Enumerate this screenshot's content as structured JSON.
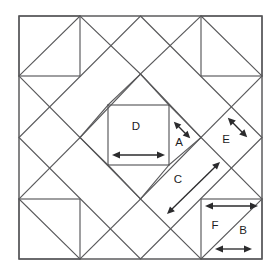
{
  "figure": {
    "type": "geometric-quilt-block-diagram",
    "background_color": "#ffffff",
    "line_color": "#58585a",
    "arrow_color": "#2b2b2d",
    "label_color": "#1c1c1e"
  },
  "frame": {
    "name": "outer-square",
    "left": 19,
    "top": 16,
    "right": 262,
    "bottom": 259,
    "width": 243,
    "height": 243
  },
  "corner_squares": [
    {
      "name": "top-left-corner-square",
      "left": 19,
      "top": 16,
      "right": 80,
      "bottom": 76,
      "diagonal": "top-right-to-bottom-left"
    },
    {
      "name": "top-right-corner-square",
      "left": 201,
      "top": 16,
      "right": 262,
      "bottom": 76,
      "diagonal": "top-left-to-bottom-right"
    },
    {
      "name": "bottom-left-corner-square",
      "left": 19,
      "top": 199,
      "right": 80,
      "bottom": 259,
      "diagonal": "top-left-to-bottom-right"
    },
    {
      "name": "bottom-right-corner-square",
      "left": 201,
      "top": 199,
      "right": 262,
      "bottom": 259,
      "diagonal": "bottom-left-to-top-right"
    }
  ],
  "center_square": {
    "name": "center-square-D",
    "left": 108,
    "top": 105,
    "right": 169,
    "bottom": 165
  },
  "outer_diamond": {
    "name": "outer-diamond",
    "vertices": [
      [
        140.5,
        16
      ],
      [
        262,
        137.5
      ],
      [
        140.5,
        259
      ],
      [
        19,
        137.5
      ]
    ]
  },
  "inner_diamond": {
    "name": "inner-diamond",
    "vertices": [
      [
        140.5,
        74
      ],
      [
        201,
        137.5
      ],
      [
        140.5,
        199
      ],
      [
        80,
        137.5
      ]
    ]
  },
  "labels": [
    {
      "id": "A",
      "text": "A",
      "x": 179,
      "y": 143,
      "measures": "short diagonal seam between center square corner and diamond edge"
    },
    {
      "id": "B",
      "text": "B",
      "x": 243,
      "y": 231,
      "measures": "short horizontal edge of corner triangle"
    },
    {
      "id": "C",
      "text": "C",
      "x": 178,
      "y": 180,
      "measures": "long diagonal edge of parallelogram patch"
    },
    {
      "id": "D",
      "text": "D",
      "x": 136,
      "y": 127,
      "measures": "width of the centre square"
    },
    {
      "id": "E",
      "text": "E",
      "x": 226,
      "y": 140,
      "measures": "side of the side-setting triangle"
    },
    {
      "id": "F",
      "text": "F",
      "x": 215,
      "y": 226,
      "measures": "horizontal edge of corner square"
    }
  ],
  "dimension_arrows": [
    {
      "name": "arrow-D",
      "label": "D",
      "orientation": "horizontal",
      "double_headed": true,
      "from": [
        114,
        155
      ],
      "to": [
        163,
        155
      ]
    },
    {
      "name": "arrow-A",
      "label": "A",
      "orientation": "diagonal-up-left",
      "double_headed": true,
      "from": [
        189,
        137
      ],
      "to": [
        175,
        123
      ]
    },
    {
      "name": "arrow-E",
      "label": "E",
      "orientation": "diagonal-up-left",
      "double_headed": true,
      "from": [
        246,
        136
      ],
      "to": [
        229,
        119
      ]
    },
    {
      "name": "arrow-C",
      "label": "C",
      "orientation": "diagonal-up-right",
      "double_headed": true,
      "from": [
        168,
        213
      ],
      "to": [
        219,
        163
      ]
    },
    {
      "name": "arrow-F",
      "label": "F",
      "orientation": "horizontal",
      "double_headed": true,
      "from": [
        207,
        206
      ],
      "to": [
        256,
        206
      ]
    },
    {
      "name": "arrow-B",
      "label": "B",
      "orientation": "horizontal",
      "double_headed": true,
      "from": [
        217,
        249
      ],
      "to": [
        250,
        249
      ]
    }
  ]
}
